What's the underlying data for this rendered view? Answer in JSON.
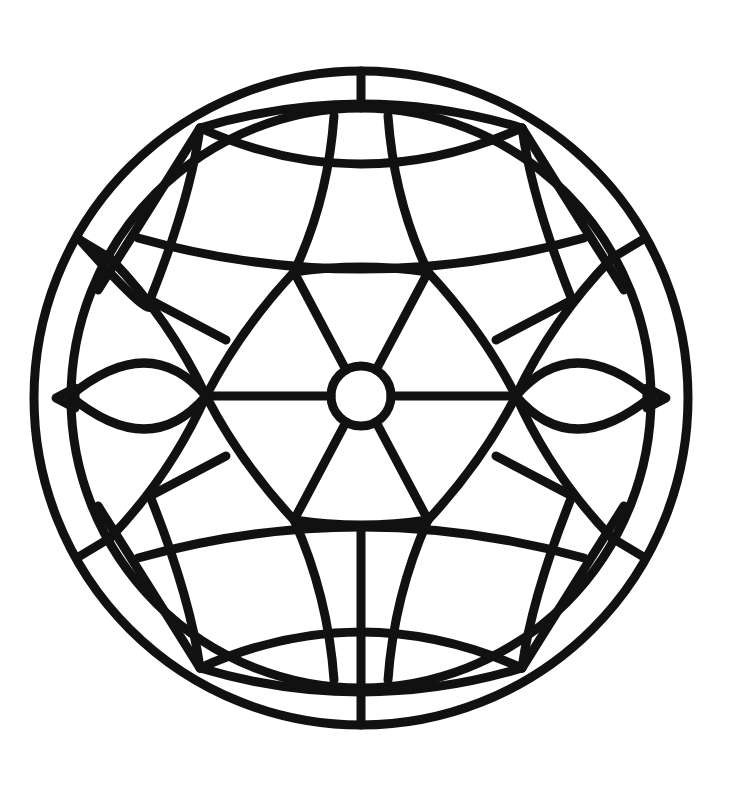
{
  "image": {
    "title": "Stained-glass mandala line art",
    "style": "black outline coloring page",
    "colors": {
      "line": "#111111",
      "background": "#ffffff"
    },
    "shapes": [
      "outer-ring",
      "inner-ring",
      "hexagram-star",
      "center-circle",
      "curved-petal-arcs"
    ]
  }
}
